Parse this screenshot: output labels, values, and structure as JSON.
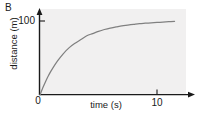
{
  "panel": {
    "label": "B"
  },
  "axis": {
    "y_label": "distance (m)",
    "x_label": "time (s)",
    "origin_label": "0",
    "y_tick_100": "100",
    "x_tick_10": "10"
  },
  "style": {
    "panel_background": "#f1f0f0",
    "axis_color": "#1a1a1a",
    "curve_color": "#808080",
    "text_color": "#1a1a1a"
  },
  "chart_data": {
    "type": "line",
    "title": "B",
    "xlabel": "time (s)",
    "ylabel": "distance (m)",
    "xlim": [
      0,
      13
    ],
    "ylim": [
      0,
      118
    ],
    "xticks": [
      0,
      10
    ],
    "xticklabels": [
      "0",
      "10"
    ],
    "yticks": [
      0,
      100
    ],
    "yticklabels": [
      "0",
      "100"
    ],
    "grid": false,
    "legend": null,
    "series": [
      {
        "name": "distance",
        "x": [
          0,
          0.25,
          0.5,
          0.75,
          1,
          1.5,
          2,
          2.5,
          3,
          3.5,
          4,
          4.5,
          5,
          5.5,
          6,
          6.5,
          7,
          7.5,
          8,
          8.5,
          9,
          9.5,
          10,
          10.5,
          11,
          11.5
        ],
        "y": [
          0,
          10,
          19,
          27,
          34,
          46,
          56,
          64,
          70,
          75,
          80,
          83,
          86,
          88.5,
          90.5,
          92,
          93.5,
          94.5,
          95.5,
          96.5,
          97,
          97.5,
          98,
          98.5,
          99,
          99.5
        ]
      }
    ]
  }
}
